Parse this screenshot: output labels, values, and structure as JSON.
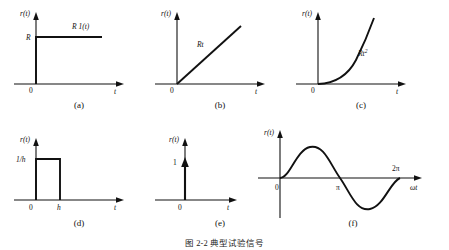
{
  "figure": {
    "caption": "图 2-2 典型试验信号",
    "background": "#ffffff",
    "ink": "#111111"
  },
  "panels": [
    {
      "id": "a",
      "caption": "(a)",
      "name": "unit-step-signal",
      "y_axis_label": "r(t)",
      "x_axis_label": "t",
      "origin_label": "0",
      "value_label": "R",
      "curve_label": "R 1(t)",
      "description": "step function of height R starting at t=0"
    },
    {
      "id": "b",
      "caption": "(b)",
      "name": "ramp-signal",
      "y_axis_label": "r(t)",
      "x_axis_label": "t",
      "origin_label": "0",
      "curve_label": "Rt",
      "description": "linear ramp with slope R from origin"
    },
    {
      "id": "c",
      "caption": "(c)",
      "name": "parabolic-signal",
      "y_axis_label": "r(t)",
      "x_axis_label": "t",
      "origin_label": "0",
      "curve_label": "Rt",
      "curve_label_exp": "2",
      "description": "parabolic acceleration signal Rt squared"
    },
    {
      "id": "d",
      "caption": "(d)",
      "name": "rectangular-pulse-signal",
      "y_axis_label": "r(t)",
      "x_axis_label": "t",
      "origin_label": "0",
      "value_label": "1/h",
      "width_label": "h",
      "description": "rectangular pulse of height 1/h and width h"
    },
    {
      "id": "e",
      "caption": "(e)",
      "name": "impulse-signal",
      "y_axis_label": "r(t)",
      "x_axis_label": "t",
      "origin_label": "0",
      "value_label": "1",
      "description": "unit impulse delta function at t=0"
    },
    {
      "id": "f",
      "caption": "(f)",
      "name": "sinusoidal-signal",
      "y_axis_label": "r(t)",
      "x_axis_label": "ωt",
      "origin_label": "0",
      "tick_pi": "π",
      "tick_2pi": "2π",
      "description": "sine wave over zero to two pi"
    }
  ]
}
